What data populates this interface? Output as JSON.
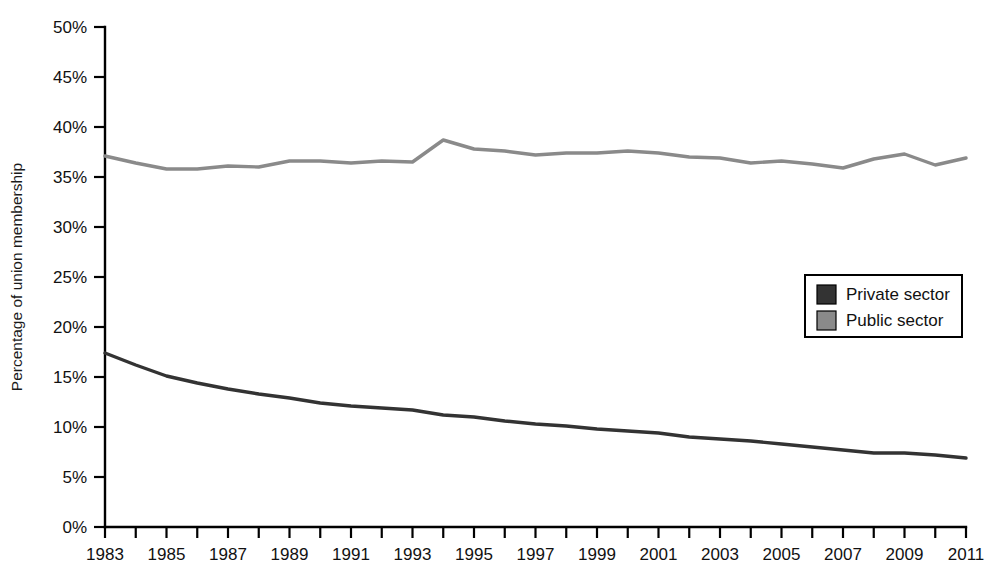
{
  "chart_data": {
    "type": "line",
    "title": "",
    "xlabel": "",
    "ylabel": "Percentage of union membership",
    "xlim": [
      1983,
      2011
    ],
    "ylim": [
      0,
      50
    ],
    "y_tick_step": 5,
    "x_tick_step": 1,
    "x_label_step": 2,
    "grid": false,
    "legend_position": "right-middle",
    "y_ticks": [
      "0%",
      "5%",
      "10%",
      "15%",
      "20%",
      "25%",
      "30%",
      "35%",
      "40%",
      "45%",
      "50%"
    ],
    "x_ticks": [
      "1983",
      "1985",
      "1987",
      "1989",
      "1991",
      "1993",
      "1995",
      "1997",
      "1999",
      "2001",
      "2003",
      "2005",
      "2007",
      "2009",
      "2011"
    ],
    "x": [
      1983,
      1984,
      1985,
      1986,
      1987,
      1988,
      1989,
      1990,
      1991,
      1992,
      1993,
      1994,
      1995,
      1996,
      1997,
      1998,
      1999,
      2000,
      2001,
      2002,
      2003,
      2004,
      2005,
      2006,
      2007,
      2008,
      2009,
      2010,
      2011
    ],
    "series": [
      {
        "name": "Private sector",
        "color": "#333333",
        "values": [
          17.4,
          16.2,
          15.1,
          14.4,
          13.8,
          13.3,
          12.9,
          12.4,
          12.1,
          11.9,
          11.7,
          11.2,
          11.0,
          10.6,
          10.3,
          10.1,
          9.8,
          9.6,
          9.4,
          9.0,
          8.8,
          8.6,
          8.3,
          8.0,
          7.7,
          7.4,
          7.4,
          7.2,
          6.9
        ]
      },
      {
        "name": "Public sector",
        "color": "#8a8a8a",
        "values": [
          37.1,
          36.4,
          35.8,
          35.8,
          36.1,
          36.0,
          36.6,
          36.6,
          36.4,
          36.6,
          36.5,
          38.7,
          37.8,
          37.6,
          37.2,
          37.4,
          37.4,
          37.6,
          37.4,
          37.0,
          36.9,
          36.4,
          36.6,
          36.3,
          35.9,
          36.8,
          37.3,
          36.2,
          36.9
        ]
      }
    ],
    "annotations": []
  },
  "legend": {
    "items": [
      {
        "label": "Private sector",
        "color": "#333333"
      },
      {
        "label": "Public sector",
        "color": "#8a8a8a"
      }
    ]
  }
}
